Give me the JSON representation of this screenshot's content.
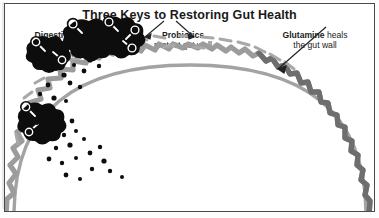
{
  "figure": {
    "title": "Three Keys to Restoring Gut Health",
    "background_color": "#ffffff",
    "border_color": "#4a4a4a",
    "width": 379,
    "height": 218
  },
  "labels": {
    "enzymes": {
      "heading": "Digestive enzymes",
      "line2": "break down",
      "line3": "food properly"
    },
    "probiotics": {
      "heading": "Probiotics",
      "line2": "protect gut wall"
    },
    "glutamine": {
      "heading": "Glutamine",
      "heading_tail": " heals",
      "line2": "the gut wall"
    }
  },
  "diagram": {
    "type": "gut-wall-cross-section",
    "colors": {
      "gut_wall_arc": "#a0a0a0",
      "villi_wave": "#9a9a9a",
      "villi_wave_healed": "#6b6b6b",
      "probiotic_dash": "#a8a8a8",
      "enzyme_blob": "#0d0d0d",
      "food_particle": "#0d0d0d",
      "arrow": "#222222"
    },
    "elements": [
      {
        "name": "gut-wall-arc",
        "description": "smooth gray dome representing the gut wall"
      },
      {
        "name": "villi-wave",
        "description": "light gray zigzag wave following the arc (intestinal villi)"
      },
      {
        "name": "villi-wave-healed",
        "description": "darker gray zigzag overlay on the right side where glutamine heals"
      },
      {
        "name": "probiotic-dashes",
        "description": "short gray dashes above the wave crests, top center"
      },
      {
        "name": "enzyme-blobs",
        "description": "black irregular blobs with white hook shapes, upper left"
      },
      {
        "name": "food-particles",
        "description": "scattered small black dots inside the lumen"
      },
      {
        "name": "probiotic-arrows",
        "description": "two short arrows splaying down from the Probiotics label"
      },
      {
        "name": "glutamine-arrow",
        "description": "long diagonal arrow from Glutamine label to the dark wave"
      }
    ],
    "counts": {
      "enzyme_blobs": 4,
      "probiotic_dashes": 16,
      "food_particles": 34
    }
  }
}
